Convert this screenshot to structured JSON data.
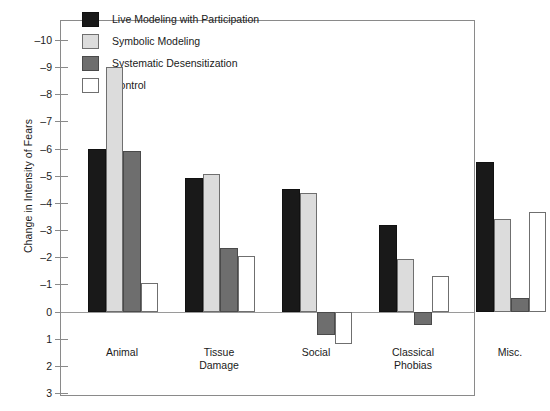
{
  "chart_data": {
    "type": "bar",
    "title": "",
    "xlabel": "",
    "ylabel": "Change in Intensity of Fears",
    "categories": [
      "Animal",
      "Tissue\nDamage",
      "Social",
      "Classical\nPhobias",
      "Misc."
    ],
    "ylim": [
      3,
      -10
    ],
    "y_ticks": [
      -10,
      -9,
      -8,
      -7,
      -6,
      -5,
      -4,
      -3,
      -2,
      -1,
      0,
      1,
      2,
      3
    ],
    "y_tick_labels": [
      "–10",
      "–9",
      "–8",
      "–7",
      "–6",
      "–5",
      "–4",
      "–3",
      "–2",
      "–1",
      "0",
      "1",
      "2",
      "3"
    ],
    "grid": false,
    "legend_position": "top-left-inside",
    "series": [
      {
        "name": "Live Modeling with Participation",
        "color": "#191919",
        "values": [
          -6.0,
          -4.9,
          -4.5,
          -3.2,
          -5.5
        ]
      },
      {
        "name": "Symbolic Modeling",
        "color": "#dcdcdc",
        "values": [
          -9.0,
          -5.05,
          -4.35,
          -1.95,
          -3.4
        ]
      },
      {
        "name": "Systematic Desensitization",
        "color": "#6e6e6e",
        "values": [
          -5.9,
          -2.35,
          0.85,
          0.5,
          -0.5
        ]
      },
      {
        "name": "Control",
        "color": "#ffffff",
        "values": [
          -1.05,
          -2.05,
          1.2,
          -1.3,
          -3.65
        ]
      }
    ]
  },
  "legend": {
    "items": [
      {
        "label": "Live Modeling with Participation",
        "key": "live"
      },
      {
        "label": "Symbolic Modeling",
        "key": "symbolic"
      },
      {
        "label": "Systematic Desensitization",
        "key": "systematic"
      },
      {
        "label": "Control",
        "key": "control"
      }
    ]
  },
  "colors": {
    "live": "#191919",
    "symbolic": "#dcdcdc",
    "systematic": "#6e6e6e",
    "control": "#ffffff",
    "axis": "#8a8a8a",
    "text": "#1a1a1a"
  }
}
